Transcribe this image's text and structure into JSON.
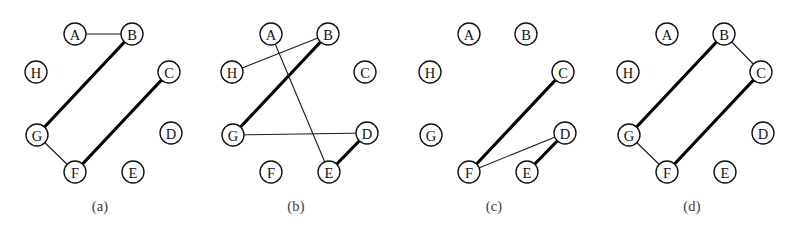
{
  "figure": {
    "background_color": "#ffffff",
    "node_stroke_color": "#111111",
    "node_fill_color": "#ffffff",
    "edge_thin_color": "#1a1a1a",
    "edge_thick_color": "#000000",
    "node_radius": 11,
    "edge_thin_width": 1.1,
    "edge_thick_width": 3.2,
    "node_positions": {
      "A": {
        "x": 75,
        "y": 34
      },
      "B": {
        "x": 132,
        "y": 34
      },
      "C": {
        "x": 169,
        "y": 72
      },
      "D": {
        "x": 171,
        "y": 133
      },
      "E": {
        "x": 133,
        "y": 172
      },
      "F": {
        "x": 75,
        "y": 172
      },
      "G": {
        "x": 37,
        "y": 135
      },
      "H": {
        "x": 36,
        "y": 72
      }
    },
    "node_ids": [
      "A",
      "B",
      "C",
      "D",
      "E",
      "F",
      "G",
      "H"
    ],
    "panels": [
      {
        "id": "panel-a",
        "caption": "(a)",
        "offset_x": 0,
        "nodes": [
          {
            "id": "A",
            "label": "A"
          },
          {
            "id": "B",
            "label": "B"
          },
          {
            "id": "C",
            "label": "C"
          },
          {
            "id": "D",
            "label": "D"
          },
          {
            "id": "E",
            "label": "E"
          },
          {
            "id": "F",
            "label": "F"
          },
          {
            "id": "G",
            "label": "G"
          },
          {
            "id": "H",
            "label": "H"
          }
        ],
        "edges": [
          {
            "from": "A",
            "to": "B",
            "weight": "thin"
          },
          {
            "from": "B",
            "to": "G",
            "weight": "thick"
          },
          {
            "from": "G",
            "to": "F",
            "weight": "thin"
          },
          {
            "from": "F",
            "to": "C",
            "weight": "thick"
          }
        ]
      },
      {
        "id": "panel-b",
        "caption": "(b)",
        "offset_x": 196,
        "nodes": [
          {
            "id": "A",
            "label": "A"
          },
          {
            "id": "B",
            "label": "B"
          },
          {
            "id": "C",
            "label": "C"
          },
          {
            "id": "D",
            "label": "D"
          },
          {
            "id": "E",
            "label": "E"
          },
          {
            "id": "F",
            "label": "F"
          },
          {
            "id": "G",
            "label": "G"
          },
          {
            "id": "H",
            "label": "H"
          }
        ],
        "edges": [
          {
            "from": "H",
            "to": "B",
            "weight": "thin"
          },
          {
            "from": "B",
            "to": "G",
            "weight": "thick"
          },
          {
            "from": "A",
            "to": "E",
            "weight": "thin"
          },
          {
            "from": "G",
            "to": "D",
            "weight": "thin"
          },
          {
            "from": "D",
            "to": "E",
            "weight": "thick"
          }
        ]
      },
      {
        "id": "panel-c",
        "caption": "(c)",
        "offset_x": 394,
        "nodes": [
          {
            "id": "A",
            "label": "A"
          },
          {
            "id": "B",
            "label": "B"
          },
          {
            "id": "C",
            "label": "C"
          },
          {
            "id": "D",
            "label": "D"
          },
          {
            "id": "E",
            "label": "E"
          },
          {
            "id": "F",
            "label": "F"
          },
          {
            "id": "G",
            "label": "G"
          },
          {
            "id": "H",
            "label": "H"
          }
        ],
        "edges": [
          {
            "from": "F",
            "to": "C",
            "weight": "thick"
          },
          {
            "from": "F",
            "to": "D",
            "weight": "thin"
          },
          {
            "from": "D",
            "to": "E",
            "weight": "thick"
          }
        ]
      },
      {
        "id": "panel-d",
        "caption": "(d)",
        "offset_x": 592,
        "nodes": [
          {
            "id": "A",
            "label": "A"
          },
          {
            "id": "B",
            "label": "B"
          },
          {
            "id": "C",
            "label": "C"
          },
          {
            "id": "D",
            "label": "D"
          },
          {
            "id": "E",
            "label": "E"
          },
          {
            "id": "F",
            "label": "F"
          },
          {
            "id": "G",
            "label": "G"
          },
          {
            "id": "H",
            "label": "H"
          }
        ],
        "edges": [
          {
            "from": "B",
            "to": "G",
            "weight": "thick"
          },
          {
            "from": "B",
            "to": "C",
            "weight": "thin"
          },
          {
            "from": "C",
            "to": "F",
            "weight": "thick"
          },
          {
            "from": "G",
            "to": "F",
            "weight": "thin"
          }
        ]
      }
    ]
  }
}
